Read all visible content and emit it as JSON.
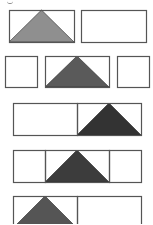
{
  "figure": {
    "stroke_color": "#555555",
    "rows": [
      {
        "id": "row-1",
        "cells": [
          {
            "x": 9,
            "y": 10,
            "w": 65,
            "h": 32
          },
          {
            "x": 81,
            "y": 10,
            "w": 65,
            "h": 32
          }
        ],
        "triangle": {
          "cell": 0,
          "fill": "#8f8f8f"
        }
      },
      {
        "id": "row-2",
        "cells": [
          {
            "x": 5,
            "y": 56,
            "w": 32,
            "h": 31
          },
          {
            "x": 45,
            "y": 56,
            "w": 64,
            "h": 31
          },
          {
            "x": 117,
            "y": 56,
            "w": 32,
            "h": 31
          }
        ],
        "triangle": {
          "cell": 1,
          "fill": "#5a5a5a"
        }
      },
      {
        "id": "row-3",
        "cells": [
          {
            "x": 13,
            "y": 103,
            "w": 64,
            "h": 32
          },
          {
            "x": 77,
            "y": 103,
            "w": 64,
            "h": 32
          }
        ],
        "triangle": {
          "cell": 1,
          "fill": "#333333"
        }
      },
      {
        "id": "row-4",
        "cells": [
          {
            "x": 13,
            "y": 150,
            "w": 32,
            "h": 32
          },
          {
            "x": 45,
            "y": 150,
            "w": 64,
            "h": 32
          },
          {
            "x": 109,
            "y": 150,
            "w": 32,
            "h": 32
          }
        ],
        "triangle": {
          "cell": 1,
          "fill": "#3c3c3c"
        }
      },
      {
        "id": "row-5",
        "cells": [
          {
            "x": 13,
            "y": 196,
            "w": 64,
            "h": 32
          },
          {
            "x": 77,
            "y": 196,
            "w": 64,
            "h": 32
          }
        ],
        "triangle": {
          "cell": 0,
          "fill": "#555555"
        }
      }
    ]
  }
}
